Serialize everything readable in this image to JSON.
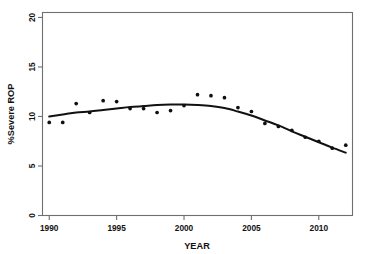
{
  "chart_data": {
    "type": "scatter",
    "title": "",
    "xlabel": "YEAR",
    "ylabel": "%Severe ROP",
    "xlim": [
      1989.5,
      2012.5
    ],
    "ylim": [
      0,
      20.5
    ],
    "xticks": [
      1990,
      1995,
      2000,
      2005,
      2010
    ],
    "xtick_labels": [
      "1990",
      "1995",
      "2000",
      "2005",
      "2010"
    ],
    "yticks": [
      0,
      5,
      10,
      15,
      20
    ],
    "ytick_labels": [
      "0",
      "5",
      "10",
      "15",
      "20"
    ],
    "grid": false,
    "legend": null,
    "frame": "box",
    "marker": "dot",
    "marker_color": "#101010",
    "curve_color": "#111111",
    "axis_color": "#6f6f6f",
    "x": [
      1990,
      1991,
      1992,
      1993,
      1994,
      1995,
      1996,
      1997,
      1998,
      1999,
      2000,
      2001,
      2002,
      2003,
      2004,
      2005,
      2006,
      2007,
      2008,
      2009,
      2010,
      2011,
      2012
    ],
    "series": [
      {
        "name": "%Severe ROP (observed)",
        "type": "scatter",
        "values": [
          9.4,
          9.4,
          11.3,
          10.4,
          11.6,
          11.5,
          10.8,
          10.8,
          10.4,
          10.6,
          11.1,
          12.2,
          12.1,
          11.9,
          10.9,
          10.5,
          9.3,
          9.0,
          8.6,
          7.9,
          7.5,
          6.8,
          7.1
        ]
      },
      {
        "name": "Fitted smooth curve",
        "type": "line",
        "values": [
          10.0,
          10.2,
          10.4,
          10.5,
          10.65,
          10.8,
          10.95,
          11.05,
          11.15,
          11.2,
          11.2,
          11.15,
          11.05,
          10.85,
          10.5,
          10.1,
          9.6,
          9.1,
          8.5,
          7.95,
          7.4,
          6.85,
          6.35
        ]
      }
    ]
  }
}
